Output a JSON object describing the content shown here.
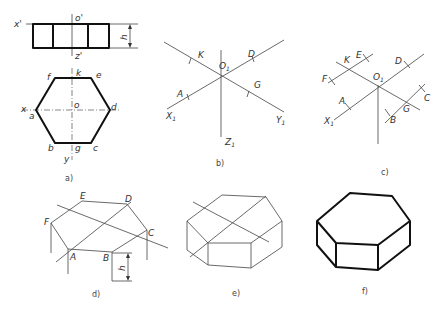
{
  "figure": {
    "panels": [
      {
        "id": "a",
        "caption": "a)",
        "labels": {
          "x_prime": "x'",
          "o_prime": "o'",
          "z_prime": "z'",
          "h": "h",
          "f": "f",
          "k": "k",
          "e": "e",
          "x": "x",
          "a": "a",
          "o": "o",
          "d": "d",
          "b": "b",
          "g": "g",
          "c": "c",
          "y": "y"
        }
      },
      {
        "id": "b",
        "caption": "b)",
        "labels": {
          "K": "K",
          "D": "D",
          "O1": "O",
          "A": "A",
          "G": "G",
          "X1": "X",
          "Y1": "Y",
          "Z1": "Z",
          "sub": "1"
        }
      },
      {
        "id": "c",
        "caption": "c)",
        "labels": {
          "K": "K",
          "E": "E",
          "D": "D",
          "F": "F",
          "O1": "O",
          "A": "A",
          "G": "G",
          "C": "C",
          "B": "B",
          "X1": "X",
          "sub": "1"
        }
      },
      {
        "id": "d",
        "caption": "d)",
        "labels": {
          "E": "E",
          "D": "D",
          "F": "F",
          "C": "C",
          "A": "A",
          "B": "B",
          "h": "h"
        }
      },
      {
        "id": "e",
        "caption": "e)"
      },
      {
        "id": "f",
        "caption": "f)"
      }
    ]
  }
}
